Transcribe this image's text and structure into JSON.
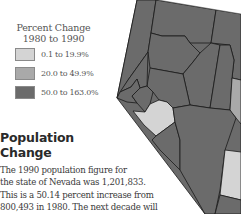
{
  "legend": {
    "title_line1": "Percent Change",
    "title_line2": "1980 to 1990",
    "items": [
      {
        "label": "0.1 to 19.9%",
        "color": "#d4d4d4"
      },
      {
        "label": "20.0 to 49.9%",
        "color": "#a9a9a9"
      },
      {
        "label": "50.0 to 163.0%",
        "color": "#6b6b6b"
      }
    ]
  },
  "heading": {
    "line1": "Population",
    "line2": "Change"
  },
  "body": {
    "lines": [
      "The 1990 population figure for",
      "the state of Nevada was 1,201,833.",
      "This is a 50.14 percent increase from",
      "800,493 in 1980. The next decade will"
    ]
  },
  "map": {
    "state": "Nevada",
    "colors": {
      "low": "#d4d4d4",
      "mid": "#a9a9a9",
      "high": "#6b6b6b",
      "border": "#1a1a1a"
    }
  }
}
